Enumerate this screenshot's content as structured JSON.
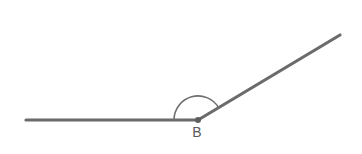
{
  "figure": {
    "kind": "geometry-angle-diagram",
    "background_color": "#ffffff",
    "width": 362,
    "height": 154,
    "stroke_color": "#6b6b6b",
    "arc_color": "#6f6f6f",
    "label_color": "#5a5a5a"
  },
  "vertex": {
    "label": "B",
    "x": 198,
    "y": 120,
    "label_x": 197,
    "label_y": 137
  },
  "rays": [
    {
      "name": "horizontal-ray",
      "from_x": 26,
      "from_y": 120,
      "to_x": 198,
      "to_y": 120,
      "direction": "left",
      "length_px": 172
    },
    {
      "name": "upper-right-ray",
      "from_x": 198,
      "from_y": 120,
      "to_x": 340,
      "to_y": 35,
      "direction": "upper-right",
      "length_px": 165
    }
  ],
  "angle_arc": {
    "name": "interior-angle-arc",
    "center_x": 198,
    "center_y": 120,
    "radius": 24,
    "start_x": 174,
    "start_y": 120,
    "end_x": 218.6,
    "end_y": 107.6,
    "start_angle_deg": 180,
    "end_angle_deg": 31,
    "sweep_deg": 149
  }
}
